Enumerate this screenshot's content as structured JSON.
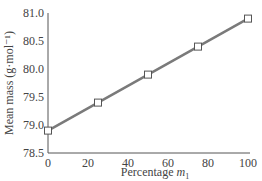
{
  "chart_data": {
    "type": "line",
    "title": "",
    "xlabel": "Percentage m₁",
    "xlabel_main": "Percentage ",
    "xlabel_var": "m",
    "xlabel_sub": "1",
    "ylabel": "Mean mass (g·mol⁻¹)",
    "x": [
      0,
      25,
      50,
      75,
      100
    ],
    "series": [
      {
        "name": "Mean mass",
        "values": [
          78.9,
          79.4,
          79.9,
          80.4,
          80.9
        ],
        "color": "#7a7a7a",
        "marker": "open-square"
      }
    ],
    "xlim": [
      0,
      100
    ],
    "ylim": [
      78.5,
      81.0
    ],
    "xticks": [
      "0",
      "20",
      "40",
      "60",
      "80",
      "100"
    ],
    "yticks": [
      "78.5",
      "79.0",
      "79.5",
      "80.0",
      "80.5",
      "81.0"
    ],
    "grid": false,
    "legend": null
  }
}
